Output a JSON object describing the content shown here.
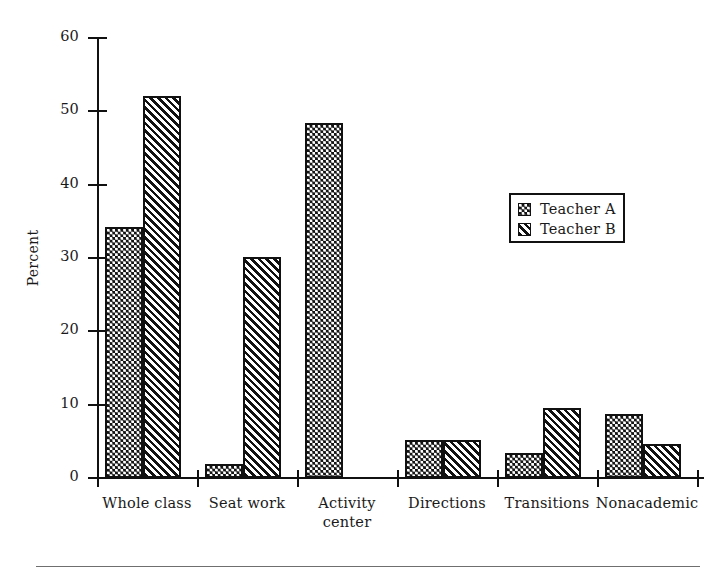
{
  "chart_data": {
    "type": "bar",
    "title": "",
    "xlabel": "",
    "ylabel": "Percent",
    "ylim": [
      0,
      60
    ],
    "yticks": [
      0,
      10,
      20,
      30,
      40,
      50,
      60
    ],
    "grid": false,
    "legend_position": "center-right",
    "categories": [
      "Whole class",
      "Seat work",
      "Activity center",
      "Directions",
      "Transitions",
      "Nonacademic"
    ],
    "category_lines": [
      [
        "Whole class"
      ],
      [
        "Seat work"
      ],
      [
        "Activity",
        "center"
      ],
      [
        "Directions"
      ],
      [
        "Transitions"
      ],
      [
        "Nonacademic"
      ]
    ],
    "series": [
      {
        "name": "Teacher A",
        "pattern": "dots",
        "values": [
          34.2,
          1.9,
          48.4,
          5.2,
          3.4,
          8.7
        ]
      },
      {
        "name": "Teacher B",
        "pattern": "hatch",
        "values": [
          52.1,
          30.1,
          0,
          5.2,
          9.6,
          4.6
        ]
      }
    ]
  },
  "legend": {
    "items": [
      {
        "label": "Teacher A",
        "pattern": "dots"
      },
      {
        "label": "Teacher B",
        "pattern": "hatch"
      }
    ]
  },
  "axis": {
    "y_title": "Percent",
    "y_tick_labels": [
      "0",
      "10",
      "20",
      "30",
      "40",
      "50",
      "60"
    ]
  },
  "colors": {
    "ink": "#111111",
    "background": "#ffffff",
    "rule": "#6f6f6f"
  }
}
